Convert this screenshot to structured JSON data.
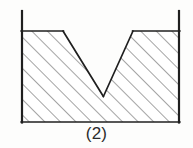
{
  "figure": {
    "caption": "(2)",
    "colors": {
      "background": "#fdfdfc",
      "outline": "#1f1f1f",
      "hatch": "#4a4a4a",
      "fill": "#ffffff",
      "caption_text": "#2b2b2b"
    },
    "geometry": {
      "left_wall_x": 22,
      "right_wall_x": 179,
      "wall_top_y": 11,
      "surface_y": 31,
      "bottom_y": 122,
      "notch_left_x": 63,
      "notch_right_x": 133,
      "notch_vertex_x": 103,
      "notch_vertex_y": 96
    },
    "hatch": {
      "angle_degrees": 45,
      "spacing_px": 11,
      "stroke_width": 1
    },
    "outline_stroke_width": 1.6,
    "wall_stroke_width": 2.2
  }
}
